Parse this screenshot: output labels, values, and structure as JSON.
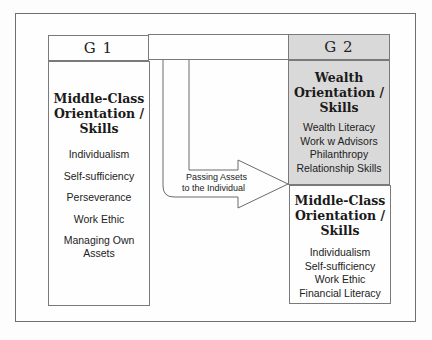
{
  "diagram": {
    "g1": {
      "header": "G 1",
      "box": {
        "title_lines": [
          "Middle-Class",
          "Orientation /",
          "Skills"
        ],
        "items": [
          "Individualism",
          "Self-sufficiency",
          "Perseverance",
          "Work Ethic",
          "Managing Own Assets"
        ]
      }
    },
    "g2": {
      "header": "G 2",
      "wealth_box": {
        "title_lines": [
          "Wealth",
          "Orientation /",
          "Skills"
        ],
        "items": [
          "Wealth Literacy",
          "Work w Advisors",
          "Philanthropy",
          "Relationship Skills"
        ],
        "fill_color": "#d9d9d9"
      },
      "middle_class_box": {
        "title_lines": [
          "Middle-Class",
          "Orientation /",
          "Skills"
        ],
        "items": [
          "Individualism",
          "Self-sufficiency",
          "Work Ethic",
          "Financial Literacy"
        ]
      }
    },
    "arrow": {
      "label_lines": [
        "Passing Assets",
        "to the Individual"
      ]
    }
  }
}
